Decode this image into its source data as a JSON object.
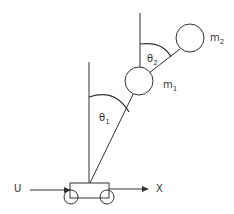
{
  "diagram": {
    "type": "cart-double-pendulum",
    "labels": {
      "theta1": "θ",
      "theta1_sub": "1",
      "theta2": "θ",
      "theta2_sub": "2",
      "m1": "m",
      "m1_sub": "1",
      "m2": "m",
      "m2_sub": "2",
      "input": "U",
      "position": "X"
    },
    "colors": {
      "stroke": "#333333",
      "background": "#ffffff"
    }
  }
}
